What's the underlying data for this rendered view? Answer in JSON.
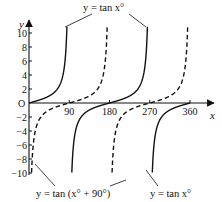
{
  "chart_data": {
    "type": "line",
    "title": "",
    "xlabel": "x",
    "ylabel": "y",
    "xlim": [
      0,
      360
    ],
    "ylim": [
      -11,
      11
    ],
    "x_ticks": [
      90,
      180,
      270,
      360
    ],
    "x_tick_labels": [
      "90",
      "180",
      "270",
      "360"
    ],
    "y_ticks": [
      10,
      8,
      6,
      4,
      2,
      -2,
      -4,
      -6,
      -8,
      -10
    ],
    "y_tick_labels": [
      "10",
      "8",
      "6",
      "4",
      "2",
      "−2",
      "−4",
      "−6",
      "−8",
      "−10"
    ],
    "origin_label": "O",
    "grid": false,
    "series": [
      {
        "name": "y = tan x°",
        "style": "solid",
        "function": "tan(x)",
        "asymptotes": [
          90,
          270
        ],
        "x": [
          0,
          30,
          45,
          60,
          75,
          80,
          84,
          89,
          91,
          96,
          100,
          105,
          120,
          135,
          150,
          180,
          210,
          225,
          240,
          255,
          260,
          264,
          269,
          271,
          276,
          280,
          285,
          300,
          315,
          330,
          360
        ],
        "y": [
          0,
          0.58,
          1,
          1.73,
          3.73,
          5.67,
          9.5,
          57,
          -57,
          -9.5,
          -5.67,
          -3.73,
          -1.73,
          -1,
          -0.58,
          0,
          0.58,
          1,
          1.73,
          3.73,
          5.67,
          9.5,
          57,
          -57,
          -9.5,
          -5.67,
          -3.73,
          -1.73,
          -1,
          -0.58,
          0
        ]
      },
      {
        "name": "y = tan (x° + 90°)",
        "style": "dashed",
        "function": "tan(x + 90)",
        "asymptotes": [
          0,
          180,
          360
        ],
        "x": [
          1,
          6,
          10,
          15,
          30,
          45,
          60,
          90,
          120,
          135,
          150,
          165,
          170,
          174,
          179,
          181,
          186,
          190,
          195,
          210,
          225,
          240,
          270,
          300,
          315,
          330,
          345,
          350,
          354,
          359
        ],
        "y": [
          -57,
          -9.5,
          -5.67,
          -3.73,
          -1.73,
          -1,
          -0.58,
          0,
          0.58,
          1,
          1.73,
          3.73,
          5.67,
          9.5,
          57,
          -57,
          -9.5,
          -5.67,
          -3.73,
          -1.73,
          -1,
          -0.58,
          0,
          0.58,
          1,
          1.73,
          3.73,
          5.67,
          9.5,
          57
        ]
      }
    ],
    "annotations": [
      {
        "text": "y = tan x°",
        "position": "top-center",
        "points_to": [
          "solid branch near x=80",
          "solid branch near x=260"
        ]
      },
      {
        "text": "y = tan (x° + 90°)",
        "position": "bottom-left",
        "points_to": [
          "dashed branch near x=10",
          "dashed branch near x=190"
        ]
      },
      {
        "text": "y = tan x°",
        "position": "bottom-right",
        "points_to": [
          "solid branch near x=280"
        ]
      }
    ],
    "legend": "none (curves labelled directly)"
  },
  "labels": {
    "x_axis": "x",
    "y_axis": "y",
    "origin": "O",
    "top_equation": "y = tan x°",
    "bottom_left_equation": "y = tan (x° + 90°)",
    "bottom_right_equation": "y = tan x°"
  }
}
